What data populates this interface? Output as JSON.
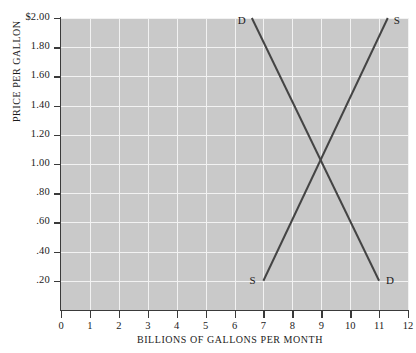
{
  "chart_data": {
    "type": "line",
    "title": "",
    "xlabel": "BILLIONS OF GALLONS PER MONTH",
    "ylabel": "PRICE PER GALLON",
    "xlim": [
      0,
      12
    ],
    "ylim": [
      0,
      2.0
    ],
    "grid": true,
    "legend_position": "inline-endpoint-labels",
    "x_ticks": [
      "0",
      "1",
      "2",
      "3",
      "4",
      "5",
      "6",
      "7",
      "8",
      "9",
      "10",
      "11",
      "12"
    ],
    "x_tick_values": [
      0,
      1,
      2,
      3,
      4,
      5,
      6,
      7,
      8,
      9,
      10,
      11,
      12
    ],
    "y_ticks": [
      "$2.00",
      "1.80",
      "1.60",
      "1.40",
      "1.20",
      "1.00",
      ".80",
      ".60",
      ".40",
      ".20"
    ],
    "y_tick_values": [
      2.0,
      1.8,
      1.6,
      1.4,
      1.2,
      1.0,
      0.8,
      0.6,
      0.4,
      0.2
    ],
    "series": [
      {
        "name": "D",
        "label": "Demand",
        "points": [
          [
            6.6,
            2.0
          ],
          [
            11.0,
            0.2
          ]
        ],
        "endpoint_labels": [
          {
            "text": "D",
            "at": [
              6.6,
              2.0
            ],
            "anchor": "top-left"
          },
          {
            "text": "D",
            "at": [
              11.0,
              0.2
            ],
            "anchor": "bottom-right"
          }
        ]
      },
      {
        "name": "S",
        "label": "Supply",
        "points": [
          [
            7.0,
            0.2
          ],
          [
            11.3,
            2.0
          ]
        ],
        "endpoint_labels": [
          {
            "text": "S",
            "at": [
              7.0,
              0.2
            ],
            "anchor": "bottom-left"
          },
          {
            "text": "S",
            "at": [
              11.3,
              2.0
            ],
            "anchor": "top-right"
          }
        ]
      }
    ],
    "equilibrium": {
      "x": 9.0,
      "y": 1.0
    },
    "colors": {
      "plot_background": "#c9c9c9",
      "gridline": "#f2f2f2",
      "curve": "#444444",
      "axis": "#3a3a3a",
      "text": "#1b1b1b",
      "page_background": "#ffffff"
    }
  }
}
